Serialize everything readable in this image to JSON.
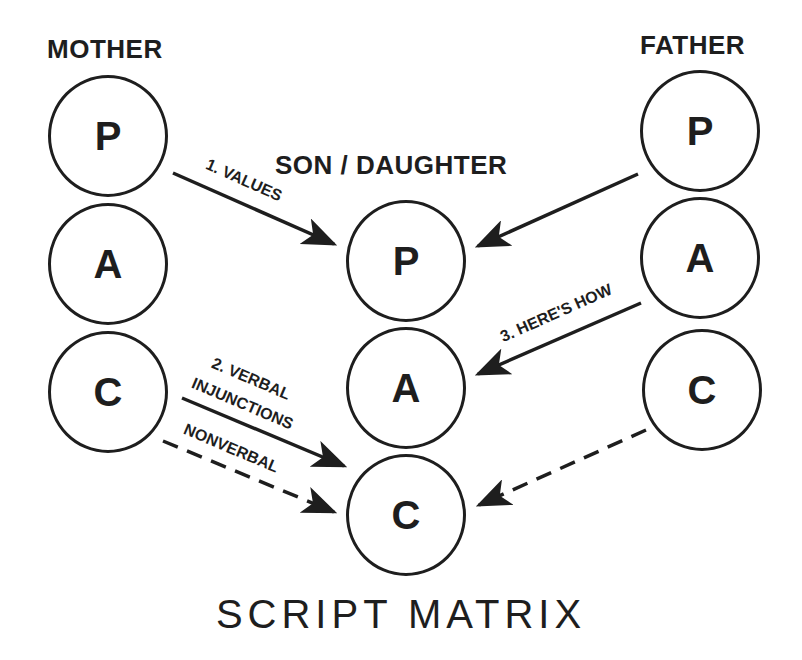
{
  "diagram": {
    "title": "SCRIPT MATRIX",
    "columns": {
      "mother": {
        "label": "MOTHER",
        "states": [
          "P",
          "A",
          "C"
        ]
      },
      "child": {
        "label": "SON / DAUGHTER",
        "states": [
          "P",
          "A",
          "C"
        ]
      },
      "father": {
        "label": "FATHER",
        "states": [
          "P",
          "A",
          "C"
        ]
      }
    },
    "arrows": [
      {
        "from": "mother.P",
        "to": "child.P",
        "label": "1. VALUES",
        "style": "solid"
      },
      {
        "from": "father.P",
        "to": "child.P",
        "label": "",
        "style": "solid"
      },
      {
        "from": "father.A",
        "to": "child.A",
        "label": "3. HERE'S HOW",
        "style": "solid"
      },
      {
        "from": "mother.C",
        "to": "child.C",
        "label_line1": "2. VERBAL",
        "label_line2": "INJUNCTIONS",
        "style": "solid"
      },
      {
        "from": "mother.C",
        "to": "child.C",
        "label": "NONVERBAL",
        "style": "dashed"
      },
      {
        "from": "father.C",
        "to": "child.C",
        "label": "",
        "style": "dashed"
      }
    ],
    "colors": {
      "ink": "#1e1e1e",
      "background": "#ffffff"
    }
  }
}
